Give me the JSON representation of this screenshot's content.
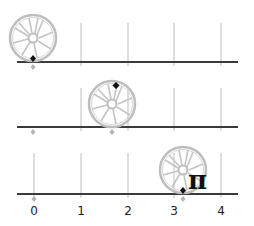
{
  "axis": {
    "ticks": [
      {
        "label": "0",
        "value": 0
      },
      {
        "label": "1",
        "value": 1
      },
      {
        "label": "2",
        "value": 2
      },
      {
        "label": "3",
        "value": 3
      },
      {
        "label": "4",
        "value": 4
      }
    ]
  },
  "annotation": {
    "symbol": "π"
  },
  "stages": [
    {
      "name": "start",
      "wheel_position": 0,
      "marker": "bottom"
    },
    {
      "name": "quarter-turn",
      "wheel_position": 1.57,
      "marker": "upper-right"
    },
    {
      "name": "half-turn",
      "wheel_position": 3.14,
      "marker": "bottom-end"
    }
  ],
  "colors": {
    "axis_line": "#3a3a3a",
    "grid_line": "#c8c8c8",
    "wheel": "#bdbdbd",
    "marker": "#111111",
    "start_marker": "#b5b5b5"
  }
}
